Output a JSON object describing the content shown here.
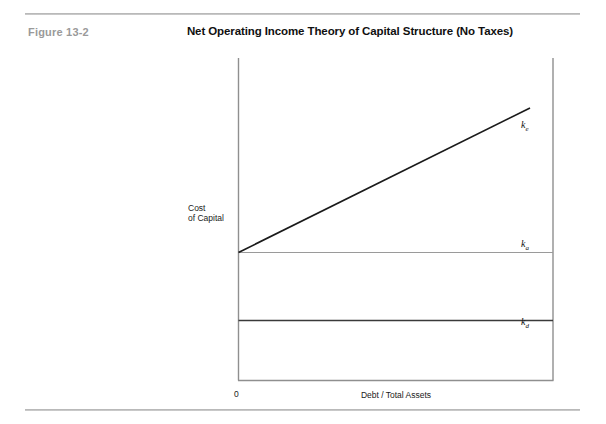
{
  "figure": {
    "label": "Figure 13-2",
    "title": "Net Operating Income Theory of Capital Structure (No Taxes)"
  },
  "chart_data": {
    "type": "line",
    "title": "Net Operating Income Theory of Capital Structure (No Taxes)",
    "xlabel": "Debt / Total Assets",
    "ylabel": "Cost of Capital",
    "xlim": [
      0,
      1
    ],
    "ylim": [
      0,
      1
    ],
    "grid": false,
    "legend": "inline-right",
    "origin_tick": "0",
    "axis_ticks": {
      "x": [
        "0"
      ],
      "y": []
    },
    "series": [
      {
        "name": "k_e",
        "label": "ke",
        "label_base": "k",
        "label_sub": "e",
        "description": "Cost of equity - rises linearly with leverage",
        "color": "#1a1a1a",
        "width": 1.6,
        "x": [
          0,
          0.926
        ],
        "y": [
          0.397,
          0.845
        ]
      },
      {
        "name": "k_a",
        "label": "ka",
        "label_base": "k",
        "label_sub": "a",
        "description": "Overall (weighted average) cost of capital - constant",
        "color": "#9a9a9a",
        "width": 1.0,
        "x": [
          0,
          1
        ],
        "y": [
          0.397,
          0.397
        ]
      },
      {
        "name": "k_d",
        "label": "kd",
        "label_base": "k",
        "label_sub": "d",
        "description": "Cost of debt - constant",
        "color": "#3a3a3a",
        "width": 1.6,
        "x": [
          0,
          1
        ],
        "y": [
          0.186,
          0.186
        ]
      }
    ]
  },
  "colors": {
    "rule": "#b9b9b9",
    "axis": "#8f8f8f",
    "figure_label": "#9a9a9a",
    "title": "#101010"
  }
}
